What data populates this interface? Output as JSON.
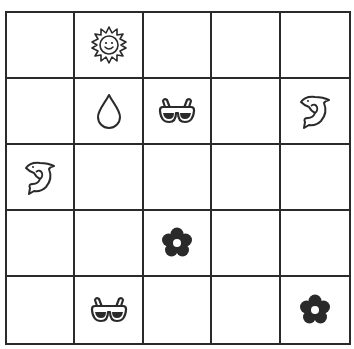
{
  "board": {
    "rows": 5,
    "cols": 5,
    "cells": [
      [
        "",
        "sun",
        "",
        "",
        ""
      ],
      [
        "",
        "drop",
        "sunglasses",
        "",
        "dolphin"
      ],
      [
        "dolphin",
        "",
        "",
        "",
        ""
      ],
      [
        "",
        "",
        "flower",
        "",
        ""
      ],
      [
        "",
        "sunglasses",
        "",
        "",
        "flower"
      ]
    ]
  },
  "colors": {
    "line": "#2a2a2a",
    "background": "#ffffff",
    "ink": "#2a2a2a"
  }
}
